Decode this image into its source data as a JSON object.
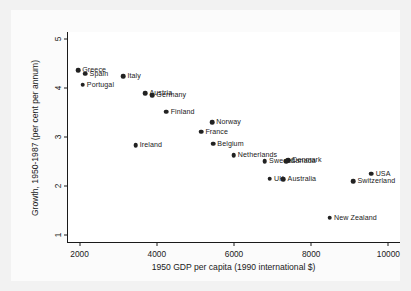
{
  "chart_data": {
    "type": "scatter",
    "title": "",
    "xlabel": "1950 GDP per capita (1990 international $)",
    "ylabel": "Growth, 1950-1987 (per cent per annum)",
    "xlim": [
      1700,
      10300
    ],
    "ylim": [
      0.85,
      5.15
    ],
    "xticks": [
      2000,
      4000,
      6000,
      8000,
      10000
    ],
    "xtick_labels": [
      "2000",
      "4000",
      "6000",
      "8000",
      "10000"
    ],
    "yticks": [
      1,
      2,
      3,
      4,
      5
    ],
    "ytick_labels": [
      "1",
      "2",
      "3",
      "4",
      "5"
    ],
    "grid": false,
    "legend": "none",
    "marker_color": "#222222",
    "points": [
      {
        "label": "Greece",
        "x": 1960,
        "y": 4.37,
        "label_side": "right"
      },
      {
        "label": "Spain",
        "x": 2150,
        "y": 4.3,
        "label_side": "right"
      },
      {
        "label": "Portugal",
        "x": 2080,
        "y": 4.07,
        "label_side": "right"
      },
      {
        "label": "Italy",
        "x": 3130,
        "y": 4.25,
        "label_side": "right"
      },
      {
        "label": "Austria",
        "x": 3700,
        "y": 3.9,
        "label_side": "right"
      },
      {
        "label": "Germany",
        "x": 3880,
        "y": 3.85,
        "label_side": "right"
      },
      {
        "label": "Finland",
        "x": 4250,
        "y": 3.52,
        "label_side": "right"
      },
      {
        "label": "Norway",
        "x": 5430,
        "y": 3.3,
        "label_side": "right"
      },
      {
        "label": "France",
        "x": 5150,
        "y": 3.11,
        "label_side": "right"
      },
      {
        "label": "Ireland",
        "x": 3450,
        "y": 2.83,
        "label_side": "right"
      },
      {
        "label": "Belgium",
        "x": 5460,
        "y": 2.86,
        "label_side": "right"
      },
      {
        "label": "Netherlands",
        "x": 5990,
        "y": 2.63,
        "label_side": "right"
      },
      {
        "label": "Denmark",
        "x": 7400,
        "y": 2.52,
        "label_side": "right"
      },
      {
        "label": "Sweden",
        "x": 6800,
        "y": 2.51,
        "label_side": "right"
      },
      {
        "label": "Canada",
        "x": 7350,
        "y": 2.5,
        "label_side": "right"
      },
      {
        "label": "UK",
        "x": 6930,
        "y": 2.15,
        "label_side": "right"
      },
      {
        "label": "Australia",
        "x": 7280,
        "y": 2.13,
        "label_side": "right"
      },
      {
        "label": "USA",
        "x": 9560,
        "y": 2.25,
        "label_side": "right"
      },
      {
        "label": "Switzerland",
        "x": 9090,
        "y": 2.1,
        "label_side": "right"
      },
      {
        "label": "New Zealand",
        "x": 8480,
        "y": 1.35,
        "label_side": "right"
      }
    ]
  }
}
